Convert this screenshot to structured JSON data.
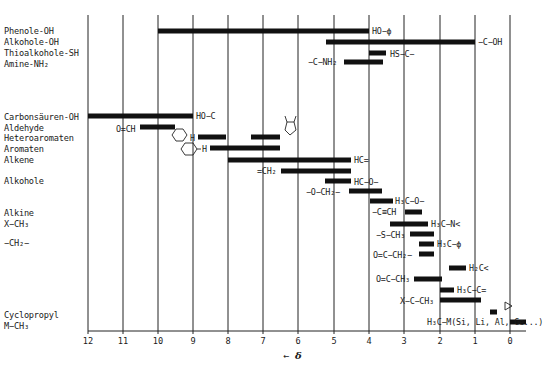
{
  "chart_data": {
    "type": "bar",
    "subtype": "horizontal-range (floating bars)",
    "title": "",
    "xlabel": "← δ",
    "ylabel": "",
    "xlim": [
      12,
      -0.5
    ],
    "x_reversed": true,
    "grid": "vertical lines at each integer ppm",
    "xticks": [
      12,
      11,
      10,
      9,
      8,
      7,
      6,
      5,
      4,
      3,
      2,
      1,
      0
    ],
    "categories": [
      "Phenole-OH",
      "Alkohole-OH",
      "Thioalkohole-SH",
      "Amine-NH₂",
      "Carbonsäuren-OH",
      "Aldehyde",
      "Heteroaromaten",
      "Aromaten",
      "Alkene",
      "Alkohole",
      "Alkine",
      "X−CH₃",
      "−CH₂−",
      "Cyclopropyl",
      "M−CH₃"
    ],
    "series": [
      {
        "group": "Phenole-OH",
        "annotation": "HO−ϕ",
        "from": 10.0,
        "to": 4.0
      },
      {
        "group": "Alkohole-OH",
        "annotation": "−C−OH",
        "from": 5.2,
        "to": 1.0
      },
      {
        "group": "Thioalkohole-SH",
        "annotation": "HS−C−",
        "from": 4.0,
        "to": 3.5
      },
      {
        "group": "Amine-NH₂",
        "annotation": "−C−NH₂",
        "from": 4.7,
        "to": 3.6
      },
      {
        "group": "Carbonsäuren-OH",
        "annotation": "HO−C(=O)",
        "from": 12.0,
        "to": 9.0
      },
      {
        "group": "Aldehyde",
        "annotation": "O=CH",
        "from": 10.5,
        "to": 9.5
      },
      {
        "group": "Heteroaromaten",
        "annotation": "2-Pyridyl-H",
        "from": 8.9,
        "to": 8.1
      },
      {
        "group": "Heteroaromaten",
        "annotation": "Pyrrol-H",
        "from": 7.4,
        "to": 6.6
      },
      {
        "group": "Aromaten",
        "annotation": "Phenyl-H",
        "from": 8.5,
        "to": 6.6
      },
      {
        "group": "Alkene",
        "annotation": "HC=",
        "from": 8.0,
        "to": 4.5
      },
      {
        "group": "Alkene",
        "annotation": "=CH₂",
        "from": 6.5,
        "to": 4.5
      },
      {
        "group": "Alkohole",
        "annotation": "HC−O−",
        "from": 5.2,
        "to": 4.5
      },
      {
        "group": "Alkohole",
        "annotation": "−O−CH₂−",
        "from": 4.6,
        "to": 3.7
      },
      {
        "group": "Alkohole",
        "annotation": "H₃C−O−",
        "from": 4.0,
        "to": 3.3
      },
      {
        "group": "Alkine",
        "annotation": "−C≡CH",
        "from": 3.0,
        "to": 2.5
      },
      {
        "group": "X−CH₃",
        "annotation": "H₃C−N<",
        "from": 3.4,
        "to": 2.3
      },
      {
        "group": "X−CH₃",
        "annotation": "−S−CH₃",
        "from": 2.8,
        "to": 2.1
      },
      {
        "group": "X−CH₃",
        "annotation": "H₃C−ϕ",
        "from": 2.6,
        "to": 2.1
      },
      {
        "group": "−CH₂−",
        "annotation": "O=C−CH₂−",
        "from": 2.6,
        "to": 2.1
      },
      {
        "group": "−CH₂−",
        "annotation": "H₂C<",
        "from": 1.7,
        "to": 1.2
      },
      {
        "group": "X−CH₃",
        "annotation": "O=C−CH₃",
        "from": 2.7,
        "to": 1.9
      },
      {
        "group": "X−CH₃",
        "annotation": "H₃C−C=",
        "from": 2.0,
        "to": 1.6
      },
      {
        "group": "X−CH₃",
        "annotation": "X−C−CH₃",
        "from": 2.0,
        "to": 0.8
      },
      {
        "group": "Cyclopropyl",
        "annotation": "Cyclopropyl-H",
        "from": 0.6,
        "to": 0.4
      },
      {
        "group": "M−CH₃",
        "annotation": "H₃C−M(Si, Li, Al, Ge...)",
        "from": 0.0,
        "to": -0.5
      }
    ]
  },
  "categories_labels": [
    {
      "text": "Phenole-OH",
      "y": 26
    },
    {
      "text": "Alkohole-OH",
      "y": 37
    },
    {
      "text": "Thioalkohole-SH",
      "y": 48
    },
    {
      "text": "Amine-NH₂",
      "y": 59
    },
    {
      "text": "Carbonsäuren-OH",
      "y": 112
    },
    {
      "text": "Aldehyde",
      "y": 123
    },
    {
      "text": "Heteroaromaten",
      "y": 133
    },
    {
      "text": "Aromaten",
      "y": 144
    },
    {
      "text": "Alkene",
      "y": 155
    },
    {
      "text": "Alkohole",
      "y": 176
    },
    {
      "text": "Alkine",
      "y": 208
    },
    {
      "text": "X−CH₃",
      "y": 219
    },
    {
      "text": "−CH₂−",
      "y": 238
    },
    {
      "text": "Cyclopropyl",
      "y": 310
    },
    {
      "text": "M−CH₃",
      "y": 321
    }
  ],
  "bars": [
    {
      "x1": 158,
      "x2": 369,
      "y": 31
    },
    {
      "x1": 326,
      "x2": 475,
      "y": 42
    },
    {
      "x1": 369,
      "x2": 386,
      "y": 53
    },
    {
      "x1": 344,
      "x2": 383,
      "y": 62
    },
    {
      "x1": 88,
      "x2": 193,
      "y": 116
    },
    {
      "x1": 140,
      "x2": 175,
      "y": 127
    },
    {
      "x1": 198,
      "x2": 226,
      "y": 137
    },
    {
      "x1": 251,
      "x2": 280,
      "y": 137
    },
    {
      "x1": 210,
      "x2": 280,
      "y": 148
    },
    {
      "x1": 228,
      "x2": 351,
      "y": 160
    },
    {
      "x1": 281,
      "x2": 351,
      "y": 171
    },
    {
      "x1": 325,
      "x2": 351,
      "y": 181
    },
    {
      "x1": 349,
      "x2": 382,
      "y": 191
    },
    {
      "x1": 370,
      "x2": 393,
      "y": 201
    },
    {
      "x1": 405,
      "x2": 422,
      "y": 212
    },
    {
      "x1": 390,
      "x2": 428,
      "y": 224
    },
    {
      "x1": 410,
      "x2": 434,
      "y": 234
    },
    {
      "x1": 419,
      "x2": 434,
      "y": 244
    },
    {
      "x1": 419,
      "x2": 434,
      "y": 254
    },
    {
      "x1": 449,
      "x2": 466,
      "y": 268
    },
    {
      "x1": 414,
      "x2": 442,
      "y": 279
    },
    {
      "x1": 440,
      "x2": 454,
      "y": 290
    },
    {
      "x1": 440,
      "x2": 481,
      "y": 300
    },
    {
      "x1": 490,
      "x2": 497,
      "y": 312
    },
    {
      "x1": 510,
      "x2": 526,
      "y": 322
    }
  ],
  "annotations": [
    {
      "text": "HO−ϕ",
      "x": 372,
      "y": 27
    },
    {
      "text": "−C−OH",
      "x": 478,
      "y": 38
    },
    {
      "text": "HS−C−",
      "x": 390,
      "y": 50
    },
    {
      "text": "−C−NH₂",
      "x": 308,
      "y": 58
    },
    {
      "text": "HO−C",
      "x": 196,
      "y": 112
    },
    {
      "text": "O=CH",
      "x": 116,
      "y": 125
    },
    {
      "text": "H",
      "x": 190,
      "y": 134
    },
    {
      "text": "H",
      "x": 202,
      "y": 145
    },
    {
      "text": "HC=",
      "x": 354,
      "y": 156
    },
    {
      "text": "=CH₂",
      "x": 257,
      "y": 167
    },
    {
      "text": "HC−O−",
      "x": 354,
      "y": 178
    },
    {
      "text": "−O−CH₂−",
      "x": 306,
      "y": 188
    },
    {
      "text": "H₃C−O−",
      "x": 395,
      "y": 197
    },
    {
      "text": "−C≡CH",
      "x": 372,
      "y": 208
    },
    {
      "text": "H₃C−N<",
      "x": 431,
      "y": 220
    },
    {
      "text": "−S−CH₃",
      "x": 376,
      "y": 231
    },
    {
      "text": "H₃C−ϕ",
      "x": 437,
      "y": 240
    },
    {
      "text": "O=C−CH₂−",
      "x": 373,
      "y": 251
    },
    {
      "text": "H₂C<",
      "x": 469,
      "y": 264
    },
    {
      "text": "O=C−CH₃",
      "x": 376,
      "y": 275
    },
    {
      "text": "H₃C−C=",
      "x": 457,
      "y": 286
    },
    {
      "text": "X−C−CH₃",
      "x": 400,
      "y": 297
    },
    {
      "text": "H₃C−M(Si, Li, Al, Ge...)",
      "x": 427,
      "y": 318
    }
  ],
  "xaxis": {
    "tick_labels": [
      "12",
      "11",
      "10",
      "9",
      "8",
      "7",
      "6",
      "5",
      "4",
      "3",
      "2",
      "1",
      "0"
    ],
    "tick_x": [
      88,
      123,
      158,
      193,
      228,
      263,
      298,
      334,
      369,
      404,
      440,
      475,
      510
    ],
    "arrow_label": "←",
    "symbol": "δ"
  },
  "colors": {
    "ink": "#111111",
    "grid": "#222222",
    "background": "#ffffff"
  }
}
